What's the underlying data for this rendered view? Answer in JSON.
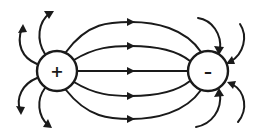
{
  "diagram": {
    "colors": {
      "stroke": "#1a1a1a",
      "background": "#ffffff"
    },
    "charges": [
      {
        "id": "positive",
        "symbol": "+",
        "cx": 57,
        "cy": 71,
        "r": 20
      },
      {
        "id": "negative",
        "symbol": "–",
        "cx": 208,
        "cy": 71,
        "r": 20
      }
    ],
    "connecting_field_lines": {
      "count": 5,
      "direction": "from positive to negative",
      "midpoint_y": [
        22,
        46,
        71,
        94,
        118
      ]
    },
    "outgoing_lines_from_positive": {
      "count": 4,
      "direction": "outward, away from positive charge"
    },
    "incoming_lines_to_negative": {
      "count": 4,
      "direction": "inward, toward negative charge"
    }
  }
}
